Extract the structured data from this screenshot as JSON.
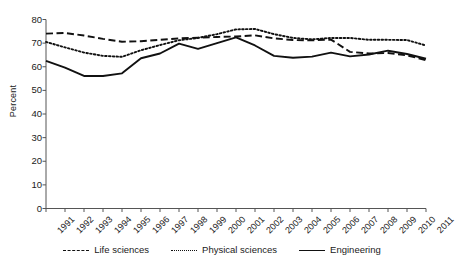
{
  "chart_data": {
    "type": "line",
    "title": "",
    "xlabel": "",
    "ylabel": "Percent",
    "ylim": [
      0,
      80
    ],
    "ytick_step": 10,
    "yticks": [
      0,
      10,
      20,
      30,
      40,
      50,
      60,
      70,
      80
    ],
    "grid": false,
    "legend_position": "bottom",
    "categories": [
      "1991",
      "1992",
      "1993",
      "1994",
      "1995",
      "1996",
      "1997",
      "1998",
      "1999",
      "2000",
      "2001",
      "2002",
      "2003",
      "2004",
      "2005",
      "2006",
      "2007",
      "2008",
      "2009",
      "2010",
      "2011"
    ],
    "series": [
      {
        "name": "Life sciences",
        "style": "dashed",
        "color": "#111111",
        "values": [
          74.0,
          74.3,
          73.2,
          71.8,
          70.6,
          70.8,
          71.4,
          72.0,
          72.3,
          72.6,
          72.8,
          73.3,
          72.0,
          71.3,
          71.2,
          71.5,
          66.3,
          65.6,
          65.8,
          64.8,
          62.8
        ]
      },
      {
        "name": "Physical sciences",
        "style": "dotted",
        "color": "#111111",
        "values": [
          70.5,
          68.2,
          66.0,
          64.6,
          64.2,
          67.0,
          69.2,
          71.2,
          72.2,
          73.8,
          75.8,
          76.0,
          73.8,
          72.2,
          71.6,
          72.2,
          72.2,
          71.4,
          71.4,
          71.3,
          69.0
        ]
      },
      {
        "name": "Engineering",
        "style": "solid",
        "color": "#111111",
        "values": [
          62.5,
          59.6,
          56.1,
          56.1,
          57.2,
          63.6,
          65.6,
          69.8,
          67.6,
          70.0,
          72.4,
          69.0,
          64.6,
          63.8,
          64.3,
          66.0,
          64.4,
          65.2,
          66.8,
          65.4,
          63.4
        ]
      }
    ]
  },
  "axis": {
    "y_title": "Percent"
  },
  "legend": {
    "items": [
      {
        "label": "Life sciences",
        "style": "dashed"
      },
      {
        "label": "Physical sciences",
        "style": "dotted"
      },
      {
        "label": "Engineering",
        "style": "solid"
      }
    ]
  }
}
